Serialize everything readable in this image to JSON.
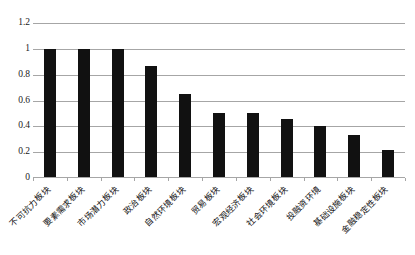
{
  "chart_data": {
    "type": "bar",
    "title": "",
    "subtitle": "",
    "xlabel": "",
    "ylabel": "",
    "ylim": [
      0,
      1.2
    ],
    "ytick_labels": [
      "1.2",
      "1",
      "0.8",
      "0.6",
      "0.4",
      "0.2",
      "0"
    ],
    "ytick_values": [
      1.2,
      1.0,
      0.8,
      0.6,
      0.4,
      0.2,
      0
    ],
    "grid": true,
    "legend": false,
    "legend_position": "none",
    "bar_color": "#111111",
    "gridline_color": "#a6a6a6",
    "categories": [
      "不可抗力板块",
      "要素需求板块",
      "市场潜力板块",
      "政治板块",
      "自然环境板块",
      "贸易板块",
      "宏观经济板块",
      "社会环境板块",
      "投融资环境",
      "基础设施板块",
      "金融稳定性板块"
    ],
    "values": [
      1.0,
      1.0,
      1.0,
      0.87,
      0.65,
      0.5,
      0.5,
      0.46,
      0.4,
      0.33,
      0.22
    ]
  }
}
